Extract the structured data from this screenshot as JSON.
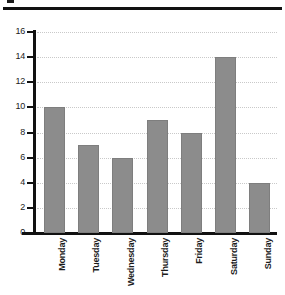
{
  "decor": {
    "top_glyph": "clipped-text-glyph",
    "rule": "horizontal-rule"
  },
  "chart_data": {
    "type": "bar",
    "title": "",
    "xlabel": "",
    "ylabel": "",
    "categories": [
      "Monday",
      "Tuesday",
      "Wednesday",
      "Thursday",
      "Friday",
      "Saturday",
      "Sunday"
    ],
    "values": [
      10,
      7,
      6,
      9,
      8,
      14,
      4
    ],
    "ylim": [
      0,
      16
    ],
    "ytick_values": [
      0,
      2,
      4,
      6,
      8,
      10,
      12,
      14,
      16
    ],
    "ytick_labels": [
      "0",
      "2",
      "4",
      "6",
      "8",
      "10",
      "12",
      "14",
      "16"
    ],
    "grid": true,
    "grid_axis": "y",
    "grid_style": "dotted",
    "legend": false,
    "xtick_rotation": 90,
    "bar_color": "#8c8c8c",
    "axis_color": "#111111",
    "grid_color": "#c9c9c9",
    "text_color": "#1b1b1b"
  }
}
